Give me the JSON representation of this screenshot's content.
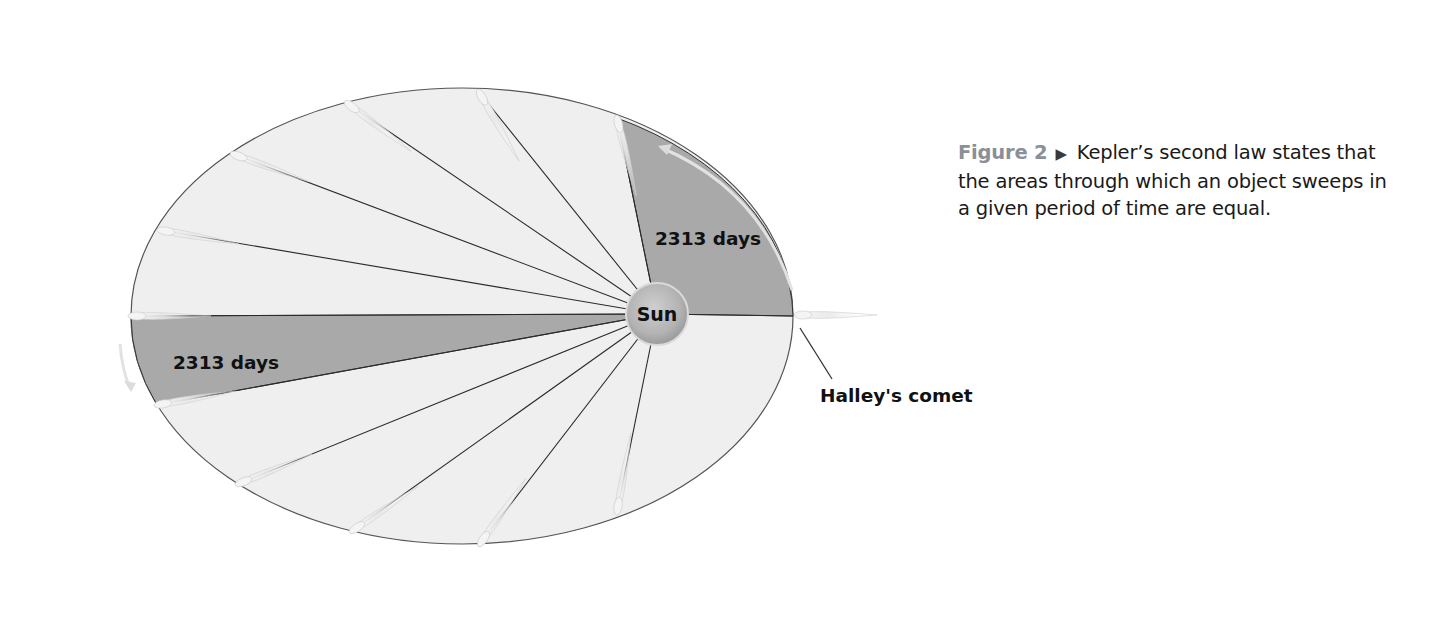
{
  "caption": {
    "figure_label": "Figure 2",
    "arrow_glyph": "▶",
    "text": "Kepler’s second law states that the areas through which an object sweeps in a given period of time are equal."
  },
  "diagram": {
    "sun_label": "Sun",
    "sector_top_label": "2313 days",
    "sector_left_label": "2313 days",
    "comet_label": "Halley's comet",
    "colors": {
      "orbit_fill": "#efefef",
      "sector_fill": "#a9a9a9",
      "line": "#333333",
      "sun": "#b5b5b5",
      "comet": "#e4e4e4",
      "figure_label": "#8a8f99"
    },
    "equal_area_sectors": 16,
    "highlighted_sectors": 2
  }
}
